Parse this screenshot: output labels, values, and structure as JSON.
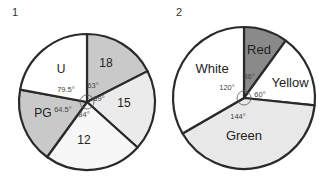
{
  "figure_labels": [
    "1",
    "2"
  ],
  "chart_data": [
    {
      "type": "pie",
      "title": "1",
      "start_angle": "top, clockwise",
      "slices": [
        {
          "label": "18",
          "angle_deg": 63,
          "angle_label": "63°",
          "color": "#c9c9c9"
        },
        {
          "label": "15",
          "angle_deg": 69,
          "angle_label": "69°",
          "color": "#ebebeb"
        },
        {
          "label": "12",
          "angle_deg": 84,
          "angle_label": "84°",
          "color": "#f7f7f7"
        },
        {
          "label": "PG",
          "angle_deg": 64.5,
          "angle_label": "64.5°",
          "color": "#c9c9c9"
        },
        {
          "label": "U",
          "angle_deg": 79.5,
          "angle_label": "79.5°",
          "color": "#ffffff"
        }
      ]
    },
    {
      "type": "pie",
      "title": "2",
      "start_angle": "top, clockwise",
      "slices": [
        {
          "label": "Red",
          "angle_deg": 36,
          "angle_label": "36°",
          "color": "#8a8a8a"
        },
        {
          "label": "Yellow",
          "angle_deg": 60,
          "angle_label": "60°",
          "color": "#ffffff"
        },
        {
          "label": "Green",
          "angle_deg": 144,
          "angle_label": "144°",
          "color": "#e8e8e8"
        },
        {
          "label": "White",
          "angle_deg": 120,
          "angle_label": "120°",
          "color": "#ffffff"
        }
      ]
    }
  ]
}
